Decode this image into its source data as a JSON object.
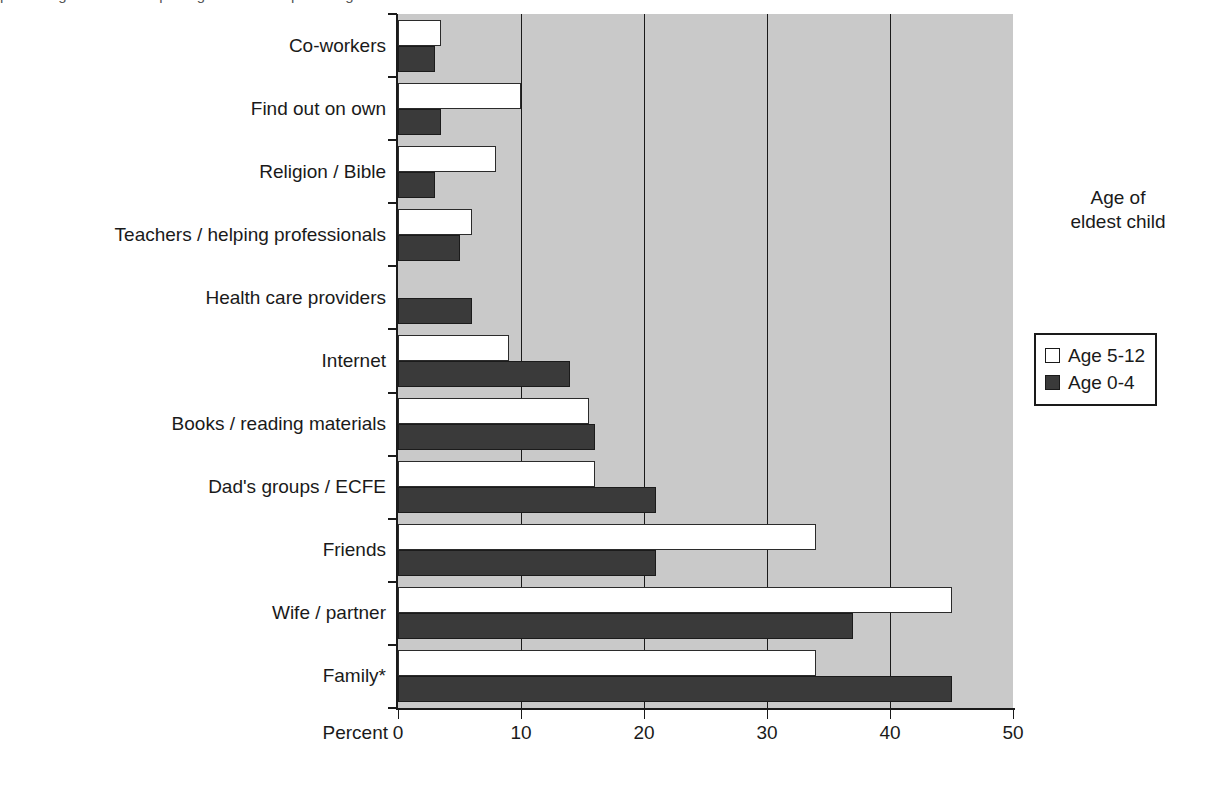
{
  "chart_data": {
    "type": "bar",
    "orientation": "horizontal",
    "title": "",
    "xlabel": "Percent",
    "ylabel": "",
    "xlim": [
      0,
      50
    ],
    "xticks": [
      0,
      10,
      20,
      30,
      40,
      50
    ],
    "xtick_labels": [
      "0",
      "10",
      "20",
      "30",
      "40",
      "50"
    ],
    "grid": "vertical",
    "legend_title": "Age of eldest child",
    "legend_position": "right",
    "categories": [
      "Co-workers",
      "Find out on own",
      "Religion / Bible",
      "Teachers / helping professionals",
      "Health care providers",
      "Internet",
      "Books / reading materials",
      "Dad's groups / ECFE",
      "Friends",
      "Wife / partner",
      "Family*"
    ],
    "series": [
      {
        "name": "Age 5-12",
        "style": "open",
        "color": "#ffffff",
        "values": [
          3.5,
          10,
          8,
          6,
          0,
          9,
          15.5,
          16,
          34,
          45,
          34
        ]
      },
      {
        "name": "Age 0-4",
        "style": "filled",
        "color": "#3a3a3a",
        "values": [
          3,
          3.5,
          3,
          5,
          6,
          14,
          16,
          21,
          21,
          37,
          45
        ]
      }
    ]
  },
  "axis": {
    "x_title": "Percent"
  },
  "legend": {
    "title_line1": "Age of",
    "title_line2": "eldest child",
    "items": [
      {
        "label": "Age 5-12"
      },
      {
        "label": "Age 0-4"
      }
    ]
  },
  "top_caption": "percentage of fathers reporting use of each parenting information source"
}
